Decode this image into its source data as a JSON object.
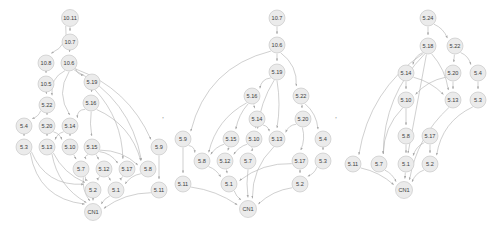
{
  "figure": {
    "background_color": "#ffffff",
    "node_fill_color": "#ebebeb",
    "node_stroke_color": "#c9c9c9",
    "edge_color": "#b0b0b0",
    "label_color": "#404040",
    "separators": [
      {
        "text": ",",
        "x": 163,
        "y": 118
      },
      {
        "text": ",",
        "x": 336,
        "y": 118
      }
    ]
  },
  "graphs": [
    {
      "id": "graph-left",
      "name": "left-dag",
      "root": "10.11",
      "sink": "CN1",
      "nodes": [
        {
          "id": "L-10.11",
          "label": "10.11",
          "x": 70,
          "y": 18,
          "r": 8.5
        },
        {
          "id": "L-10.7",
          "label": "10.7",
          "x": 70,
          "y": 42,
          "r": 8
        },
        {
          "id": "L-10.8",
          "label": "10.8",
          "x": 46,
          "y": 63,
          "r": 8
        },
        {
          "id": "L-10.6",
          "label": "10.6",
          "x": 69,
          "y": 63,
          "r": 8
        },
        {
          "id": "L-10.5",
          "label": "10.5",
          "x": 46,
          "y": 84,
          "r": 8
        },
        {
          "id": "L-5.19",
          "label": "5.19",
          "x": 92,
          "y": 82,
          "r": 8
        },
        {
          "id": "L-5.22",
          "label": "5.22",
          "x": 47,
          "y": 105,
          "r": 8
        },
        {
          "id": "L-5.16",
          "label": "5.16",
          "x": 91,
          "y": 103,
          "r": 8
        },
        {
          "id": "L-5.4",
          "label": "5.4",
          "x": 24,
          "y": 126,
          "r": 8
        },
        {
          "id": "L-5.20",
          "label": "5.20",
          "x": 47,
          "y": 126,
          "r": 8
        },
        {
          "id": "L-5.14",
          "label": "5.14",
          "x": 70,
          "y": 126,
          "r": 8
        },
        {
          "id": "L-5.3",
          "label": "5.3",
          "x": 24,
          "y": 147,
          "r": 8
        },
        {
          "id": "L-5.13",
          "label": "5.13",
          "x": 47,
          "y": 147,
          "r": 8
        },
        {
          "id": "L-5.10",
          "label": "5.10",
          "x": 70,
          "y": 147,
          "r": 8
        },
        {
          "id": "L-5.15",
          "label": "5.15",
          "x": 92,
          "y": 147,
          "r": 8
        },
        {
          "id": "L-5.9",
          "label": "5.9",
          "x": 159,
          "y": 147,
          "r": 8
        },
        {
          "id": "L-5.7",
          "label": "5.7",
          "x": 81,
          "y": 169,
          "r": 8
        },
        {
          "id": "L-5.12",
          "label": "5.12",
          "x": 104,
          "y": 169,
          "r": 8
        },
        {
          "id": "L-5.17",
          "label": "5.17",
          "x": 127,
          "y": 169,
          "r": 8
        },
        {
          "id": "L-5.8",
          "label": "5.8",
          "x": 148,
          "y": 169,
          "r": 8
        },
        {
          "id": "L-5.2",
          "label": "5.2",
          "x": 93,
          "y": 190,
          "r": 8
        },
        {
          "id": "L-5.1",
          "label": "5.1",
          "x": 116,
          "y": 190,
          "r": 8
        },
        {
          "id": "L-5.11",
          "label": "5.11",
          "x": 159,
          "y": 190,
          "r": 8
        },
        {
          "id": "L-CN1",
          "label": "CN1",
          "x": 93,
          "y": 212,
          "r": 8.5
        }
      ],
      "edges": [
        {
          "from": "L-10.11",
          "to": "L-10.7"
        },
        {
          "from": "L-10.11",
          "to": "L-10.8",
          "bend": -12
        },
        {
          "from": "L-10.7",
          "to": "L-10.6"
        },
        {
          "from": "L-10.8",
          "to": "L-10.5"
        },
        {
          "from": "L-10.5",
          "to": "L-5.22"
        },
        {
          "from": "L-10.6",
          "to": "L-5.19",
          "bend": 4
        },
        {
          "from": "L-10.6",
          "to": "L-5.22",
          "bend": 10
        },
        {
          "from": "L-10.6",
          "to": "L-5.14",
          "bend": 14
        },
        {
          "from": "L-10.6",
          "to": "L-5.9",
          "bend": -22
        },
        {
          "from": "L-10.6",
          "to": "L-5.8",
          "bend": -28
        },
        {
          "from": "L-5.19",
          "to": "L-5.16"
        },
        {
          "from": "L-5.19",
          "to": "L-5.17",
          "bend": -14
        },
        {
          "from": "L-5.22",
          "to": "L-5.4",
          "bend": -3
        },
        {
          "from": "L-5.22",
          "to": "L-5.20"
        },
        {
          "from": "L-5.16",
          "to": "L-5.14",
          "bend": 6
        },
        {
          "from": "L-5.16",
          "to": "L-5.15",
          "bend": 2
        },
        {
          "from": "L-5.16",
          "to": "L-5.8",
          "bend": -16
        },
        {
          "from": "L-5.4",
          "to": "L-5.3"
        },
        {
          "from": "L-5.20",
          "to": "L-5.13"
        },
        {
          "from": "L-5.20",
          "to": "L-5.10",
          "bend": -3
        },
        {
          "from": "L-5.14",
          "to": "L-5.13",
          "bend": 3
        },
        {
          "from": "L-5.14",
          "to": "L-5.10"
        },
        {
          "from": "L-5.3",
          "to": "L-5.2",
          "bend": 22
        },
        {
          "from": "L-5.3",
          "to": "L-CN1",
          "bend": 28
        },
        {
          "from": "L-5.13",
          "to": "L-5.2",
          "bend": 8
        },
        {
          "from": "L-5.13",
          "to": "L-CN1",
          "bend": 14
        },
        {
          "from": "L-5.10",
          "to": "L-5.7"
        },
        {
          "from": "L-5.15",
          "to": "L-5.7",
          "bend": 3
        },
        {
          "from": "L-5.15",
          "to": "L-5.12"
        },
        {
          "from": "L-5.15",
          "to": "L-5.17",
          "bend": -5
        },
        {
          "from": "L-5.15",
          "to": "L-5.8",
          "bend": -8
        },
        {
          "from": "L-5.9",
          "to": "L-5.11"
        },
        {
          "from": "L-5.7",
          "to": "L-5.2",
          "bend": 2
        },
        {
          "from": "L-5.7",
          "to": "L-CN1",
          "bend": 5
        },
        {
          "from": "L-5.12",
          "to": "L-5.2",
          "bend": 2
        },
        {
          "from": "L-5.12",
          "to": "L-5.1"
        },
        {
          "from": "L-5.17",
          "to": "L-5.1",
          "bend": 2
        },
        {
          "from": "L-5.8",
          "to": "L-5.1",
          "bend": 4
        },
        {
          "from": "L-5.2",
          "to": "L-CN1"
        },
        {
          "from": "L-5.1",
          "to": "L-CN1",
          "bend": 2
        },
        {
          "from": "L-5.11",
          "to": "L-CN1",
          "bend": 8
        }
      ]
    },
    {
      "id": "graph-middle",
      "name": "middle-dag",
      "root": "10.7",
      "sink": "CN1",
      "nodes": [
        {
          "id": "M-10.7",
          "label": "10.7",
          "x": 277,
          "y": 18,
          "r": 8
        },
        {
          "id": "M-10.6",
          "label": "10.6",
          "x": 277,
          "y": 45,
          "r": 8
        },
        {
          "id": "M-5.19",
          "label": "5.19",
          "x": 277,
          "y": 72,
          "r": 8
        },
        {
          "id": "M-5.16",
          "label": "5.16",
          "x": 252,
          "y": 96,
          "r": 8
        },
        {
          "id": "M-5.22",
          "label": "5.22",
          "x": 301,
          "y": 96,
          "r": 8
        },
        {
          "id": "M-5.14",
          "label": "5.14",
          "x": 257,
          "y": 119,
          "r": 8
        },
        {
          "id": "M-5.20",
          "label": "5.20",
          "x": 303,
          "y": 119,
          "r": 8
        },
        {
          "id": "M-5.9",
          "label": "5.9",
          "x": 183,
          "y": 139,
          "r": 8
        },
        {
          "id": "M-5.15",
          "label": "5.15",
          "x": 231,
          "y": 139,
          "r": 8
        },
        {
          "id": "M-5.10",
          "label": "5.10",
          "x": 254,
          "y": 139,
          "r": 8
        },
        {
          "id": "M-5.13",
          "label": "5.13",
          "x": 277,
          "y": 139,
          "r": 8
        },
        {
          "id": "M-5.4",
          "label": "5.4",
          "x": 323,
          "y": 139,
          "r": 8
        },
        {
          "id": "M-5.8",
          "label": "5.8",
          "x": 202,
          "y": 161,
          "r": 8
        },
        {
          "id": "M-5.12",
          "label": "5.12",
          "x": 225,
          "y": 161,
          "r": 8
        },
        {
          "id": "M-5.7",
          "label": "5.7",
          "x": 248,
          "y": 161,
          "r": 8
        },
        {
          "id": "M-5.17",
          "label": "5.17",
          "x": 300,
          "y": 161,
          "r": 8
        },
        {
          "id": "M-5.3",
          "label": "5.3",
          "x": 323,
          "y": 161,
          "r": 8
        },
        {
          "id": "M-5.11",
          "label": "5.11",
          "x": 183,
          "y": 184,
          "r": 8
        },
        {
          "id": "M-5.1",
          "label": "5.1",
          "x": 229,
          "y": 184,
          "r": 8
        },
        {
          "id": "M-5.2",
          "label": "5.2",
          "x": 300,
          "y": 184,
          "r": 8
        },
        {
          "id": "M-CN1",
          "label": "CN1",
          "x": 248,
          "y": 209,
          "r": 8.5
        }
      ],
      "edges": [
        {
          "from": "M-10.7",
          "to": "M-10.6"
        },
        {
          "from": "M-10.6",
          "to": "M-5.19"
        },
        {
          "from": "M-10.6",
          "to": "M-5.22",
          "bend": -10
        },
        {
          "from": "M-10.6",
          "to": "M-5.9",
          "bend": 34
        },
        {
          "from": "M-5.19",
          "to": "M-5.16",
          "bend": 6
        },
        {
          "from": "M-5.19",
          "to": "M-5.13",
          "bend": -4
        },
        {
          "from": "M-5.19",
          "to": "M-5.10",
          "bend": 6
        },
        {
          "from": "M-5.22",
          "to": "M-5.20"
        },
        {
          "from": "M-5.22",
          "to": "M-5.4",
          "bend": -6
        },
        {
          "from": "M-5.16",
          "to": "M-5.14"
        },
        {
          "from": "M-5.16",
          "to": "M-5.15",
          "bend": 4
        },
        {
          "from": "M-5.16",
          "to": "M-5.8",
          "bend": 14
        },
        {
          "from": "M-5.14",
          "to": "M-5.10"
        },
        {
          "from": "M-5.14",
          "to": "M-5.13",
          "bend": -3
        },
        {
          "from": "M-5.20",
          "to": "M-5.13",
          "bend": 4
        },
        {
          "from": "M-5.20",
          "to": "M-5.17",
          "bend": -4
        },
        {
          "from": "M-5.9",
          "to": "M-5.8",
          "bend": -4
        },
        {
          "from": "M-5.9",
          "to": "M-5.11"
        },
        {
          "from": "M-5.15",
          "to": "M-5.12"
        },
        {
          "from": "M-5.15",
          "to": "M-5.8",
          "bend": 3
        },
        {
          "from": "M-5.10",
          "to": "M-5.7",
          "bend": -3
        },
        {
          "from": "M-5.10",
          "to": "M-5.12",
          "bend": 3
        },
        {
          "from": "M-5.13",
          "to": "M-CN1",
          "bend": 12
        },
        {
          "from": "M-5.4",
          "to": "M-5.3"
        },
        {
          "from": "M-5.8",
          "to": "M-5.1",
          "bend": -3
        },
        {
          "from": "M-5.12",
          "to": "M-5.1"
        },
        {
          "from": "M-5.7",
          "to": "M-CN1",
          "bend": 2
        },
        {
          "from": "M-5.17",
          "to": "M-5.2"
        },
        {
          "from": "M-5.17",
          "to": "M-5.1",
          "bend": 10
        },
        {
          "from": "M-5.3",
          "to": "M-5.2",
          "bend": -3
        },
        {
          "from": "M-5.11",
          "to": "M-CN1",
          "bend": -6
        },
        {
          "from": "M-5.1",
          "to": "M-CN1",
          "bend": 2
        },
        {
          "from": "M-5.2",
          "to": "M-CN1",
          "bend": 6
        }
      ]
    },
    {
      "id": "graph-right",
      "name": "right-dag",
      "root": "5.24",
      "sink": "CN1",
      "nodes": [
        {
          "id": "R-5.24",
          "label": "5.24",
          "x": 428,
          "y": 18,
          "r": 8
        },
        {
          "id": "R-5.18",
          "label": "5.18",
          "x": 428,
          "y": 46,
          "r": 8
        },
        {
          "id": "R-5.22",
          "label": "5.22",
          "x": 455,
          "y": 46,
          "r": 8
        },
        {
          "id": "R-5.14",
          "label": "5.14",
          "x": 406,
          "y": 73,
          "r": 8
        },
        {
          "id": "R-5.20",
          "label": "5.20",
          "x": 453,
          "y": 73,
          "r": 8
        },
        {
          "id": "R-5.4",
          "label": "5.4",
          "x": 478,
          "y": 73,
          "r": 8
        },
        {
          "id": "R-5.10",
          "label": "5.10",
          "x": 406,
          "y": 100,
          "r": 8
        },
        {
          "id": "R-5.13",
          "label": "5.13",
          "x": 453,
          "y": 100,
          "r": 8
        },
        {
          "id": "R-5.3",
          "label": "5.3",
          "x": 478,
          "y": 100,
          "r": 8
        },
        {
          "id": "R-5.8",
          "label": "5.8",
          "x": 406,
          "y": 136,
          "r": 8
        },
        {
          "id": "R-5.17",
          "label": "5.17",
          "x": 430,
          "y": 136,
          "r": 8
        },
        {
          "id": "R-5.11",
          "label": "5.11",
          "x": 353,
          "y": 164,
          "r": 8
        },
        {
          "id": "R-5.7",
          "label": "5.7",
          "x": 379,
          "y": 164,
          "r": 8
        },
        {
          "id": "R-5.1",
          "label": "5.1",
          "x": 406,
          "y": 164,
          "r": 8
        },
        {
          "id": "R-5.2",
          "label": "5.2",
          "x": 430,
          "y": 164,
          "r": 8
        },
        {
          "id": "R-CN1",
          "label": "CN1",
          "x": 404,
          "y": 190,
          "r": 8.5
        }
      ],
      "edges": [
        {
          "from": "R-5.24",
          "to": "R-5.18"
        },
        {
          "from": "R-5.24",
          "to": "R-5.22",
          "bend": -4
        },
        {
          "from": "R-5.18",
          "to": "R-5.14",
          "bend": 4
        },
        {
          "from": "R-5.18",
          "to": "R-5.13",
          "bend": -6
        },
        {
          "from": "R-5.18",
          "to": "R-5.11",
          "bend": 26
        },
        {
          "from": "R-5.18",
          "to": "R-5.7",
          "bend": 22
        },
        {
          "from": "R-5.18",
          "to": "R-5.1",
          "bend": 0
        },
        {
          "from": "R-5.22",
          "to": "R-5.20"
        },
        {
          "from": "R-5.22",
          "to": "R-5.4",
          "bend": -4
        },
        {
          "from": "R-5.14",
          "to": "R-5.10"
        },
        {
          "from": "R-5.14",
          "to": "R-5.13",
          "bend": -5
        },
        {
          "from": "R-5.20",
          "to": "R-5.10",
          "bend": 6
        },
        {
          "from": "R-5.20",
          "to": "R-5.13"
        },
        {
          "from": "R-5.4",
          "to": "R-5.3"
        },
        {
          "from": "R-5.10",
          "to": "R-5.8"
        },
        {
          "from": "R-5.10",
          "to": "R-5.7",
          "bend": 10
        },
        {
          "from": "R-5.13",
          "to": "R-CN1",
          "bend": 14
        },
        {
          "from": "R-5.3",
          "to": "R-5.2",
          "bend": 16
        },
        {
          "from": "R-5.8",
          "to": "R-5.1"
        },
        {
          "from": "R-5.17",
          "to": "R-5.2"
        },
        {
          "from": "R-5.17",
          "to": "R-5.1",
          "bend": 4
        },
        {
          "from": "R-5.11",
          "to": "R-CN1",
          "bend": -5
        },
        {
          "from": "R-5.7",
          "to": "R-CN1",
          "bend": -3
        },
        {
          "from": "R-5.1",
          "to": "R-CN1"
        },
        {
          "from": "R-5.2",
          "to": "R-CN1",
          "bend": 4
        }
      ]
    }
  ]
}
